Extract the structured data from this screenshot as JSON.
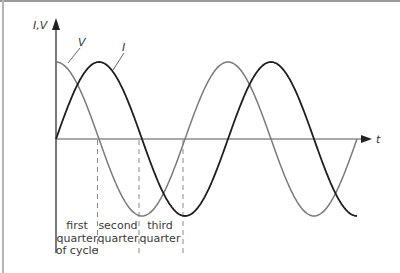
{
  "figure": {
    "y_axis_label": "I,V",
    "x_axis_label": "t",
    "curves": [
      {
        "name": "V",
        "label": "V",
        "color": "#7a7a7a",
        "phase": "cosine"
      },
      {
        "name": "I",
        "label": "I",
        "color": "#1e1e1e",
        "phase": "sine"
      }
    ],
    "regions": [
      {
        "lines": [
          "first",
          "quarter",
          "of cycle"
        ]
      },
      {
        "lines": [
          "second",
          "quarter"
        ]
      },
      {
        "lines": [
          "third",
          "quarter"
        ]
      }
    ],
    "colors": {
      "axis": "#333333",
      "dashed": "#8a8a8a",
      "frame": "#9a9a9a"
    }
  }
}
